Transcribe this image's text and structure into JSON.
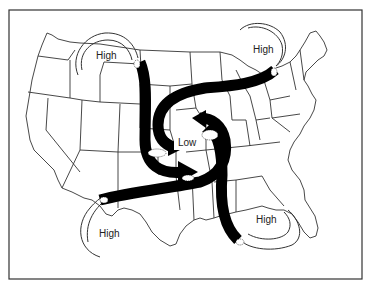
{
  "map": {
    "title": "",
    "pressure_labels": {
      "center": "Low",
      "northwest": "High",
      "northeast": "High",
      "southwest": "High",
      "southeast": "High"
    },
    "colors": {
      "background": "#ffffff",
      "border": "#333333",
      "state_lines": "#333333",
      "airflow_arrows": "#000000",
      "high_pressure_arcs": "#333333"
    }
  }
}
